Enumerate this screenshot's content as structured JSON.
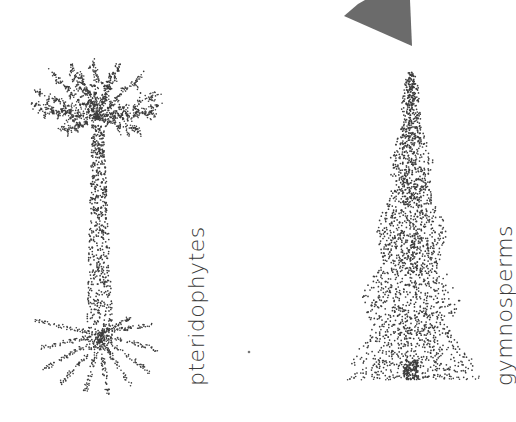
{
  "figures": [
    {
      "id": "pteridophytes",
      "label": "pteridophytes",
      "illustration": "stippled tree fern with spreading crown and roots"
    },
    {
      "id": "gymnosperms",
      "label": "gymnosperms",
      "illustration": "stippled conifer tree"
    }
  ],
  "decorations": {
    "arrow_shape_color": "#6b6b6b",
    "stipple_color": "#3c3c3c"
  }
}
